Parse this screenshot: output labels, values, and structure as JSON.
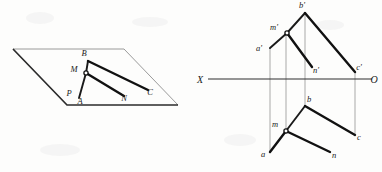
{
  "figure": {
    "background_color": "#fdfdfc",
    "line_color": "#111111",
    "thin_line_color": "#8f8f8f",
    "projector_color": "#9a9a9a"
  },
  "left_view": {
    "name": "pictorial-view",
    "plane": {
      "label": "P",
      "label_pos": {
        "x": 69,
        "y": 96
      },
      "corners": [
        {
          "x": 13,
          "y": 49
        },
        {
          "x": 124,
          "y": 49
        },
        {
          "x": 178,
          "y": 105
        },
        {
          "x": 67,
          "y": 105
        }
      ]
    },
    "points": [
      {
        "id": "B",
        "label": "B",
        "x": 88,
        "y": 61,
        "label_pos": {
          "x": 84,
          "y": 56
        }
      },
      {
        "id": "M",
        "label": "M",
        "x": 86,
        "y": 73,
        "label_pos": {
          "x": 74,
          "y": 72
        }
      },
      {
        "id": "A",
        "label": "A",
        "x": 79,
        "y": 98,
        "label_pos": {
          "x": 80,
          "y": 104
        }
      },
      {
        "id": "N",
        "label": "N",
        "x": 124,
        "y": 96,
        "label_pos": {
          "x": 124,
          "y": 101
        }
      },
      {
        "id": "C",
        "label": "C",
        "x": 148,
        "y": 90,
        "label_pos": {
          "x": 150,
          "y": 95
        }
      }
    ],
    "segments": [
      {
        "from": "M",
        "to": "B",
        "weight": "medium"
      },
      {
        "from": "M",
        "to": "A",
        "weight": "medium"
      },
      {
        "from": "M",
        "to": "N",
        "weight": "heavy"
      },
      {
        "from": "B",
        "to": "C",
        "weight": "heavy"
      }
    ]
  },
  "right_view": {
    "name": "orthographic-projection",
    "axis": {
      "left_label": "X",
      "right_label": "O",
      "y": 79,
      "x_start": 208,
      "x_end": 372,
      "left_label_pos": {
        "x": 200,
        "y": 83
      },
      "right_label_pos": {
        "x": 374,
        "y": 83
      }
    },
    "frontal_points": [
      {
        "id": "b1",
        "label": "b'",
        "x": 305,
        "y": 13,
        "label_pos": {
          "x": 302,
          "y": 8
        }
      },
      {
        "id": "m1",
        "label": "m'",
        "x": 287,
        "y": 33,
        "label_pos": {
          "x": 274,
          "y": 30
        }
      },
      {
        "id": "a1",
        "label": "a'",
        "x": 270,
        "y": 48,
        "label_pos": {
          "x": 259,
          "y": 51
        }
      },
      {
        "id": "n1",
        "label": "n'",
        "x": 312,
        "y": 67,
        "label_pos": {
          "x": 314,
          "y": 72
        }
      },
      {
        "id": "c1",
        "label": "c'",
        "x": 355,
        "y": 72,
        "label_pos": {
          "x": 357,
          "y": 70
        }
      }
    ],
    "horizontal_points": [
      {
        "id": "b",
        "label": "b",
        "x": 305,
        "y": 106,
        "label_pos": {
          "x": 307,
          "y": 102
        }
      },
      {
        "id": "m",
        "label": "m",
        "x": 286,
        "y": 131,
        "label_pos": {
          "x": 274,
          "y": 127
        }
      },
      {
        "id": "a",
        "label": "a",
        "x": 270,
        "y": 152,
        "label_pos": {
          "x": 263,
          "y": 156
        }
      },
      {
        "id": "n",
        "label": "n",
        "x": 330,
        "y": 152,
        "label_pos": {
          "x": 332,
          "y": 157
        }
      },
      {
        "id": "c",
        "label": "c",
        "x": 355,
        "y": 135,
        "label_pos": {
          "x": 357,
          "y": 140
        }
      }
    ],
    "frontal_segments": [
      {
        "from": "m1",
        "to": "b1",
        "weight": "medium"
      },
      {
        "from": "m1",
        "to": "a1",
        "weight": "medium"
      },
      {
        "from": "m1",
        "to": "n1",
        "weight": "heavy"
      },
      {
        "from": "b1",
        "to": "c1",
        "weight": "heavy"
      }
    ],
    "horizontal_segments": [
      {
        "from": "m",
        "to": "b",
        "weight": "medium"
      },
      {
        "from": "m",
        "to": "a",
        "weight": "medium"
      },
      {
        "from": "m",
        "to": "n",
        "weight": "heavy"
      },
      {
        "from": "b",
        "to": "c",
        "weight": "heavy"
      }
    ],
    "projectors": [
      {
        "x": 270,
        "y1": 48,
        "y2": 152
      },
      {
        "x": 286,
        "y1": 33,
        "y2": 131
      },
      {
        "x": 305,
        "y1": 13,
        "y2": 106
      },
      {
        "x": 355,
        "y1": 72,
        "y2": 135
      }
    ]
  }
}
